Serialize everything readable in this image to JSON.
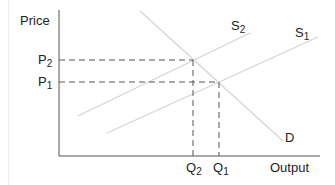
{
  "diagram": {
    "y_axis_label": "Price",
    "x_axis_label": "Output",
    "price_labels": [
      {
        "base": "P",
        "sub": "2"
      },
      {
        "base": "P",
        "sub": "1"
      }
    ],
    "quantity_labels": [
      {
        "base": "Q",
        "sub": "2"
      },
      {
        "base": "Q",
        "sub": "1"
      }
    ],
    "curves": [
      {
        "name": "D",
        "base": "D",
        "sub": ""
      },
      {
        "name": "S2",
        "base": "S",
        "sub": "2"
      },
      {
        "name": "S1",
        "base": "S",
        "sub": "1"
      }
    ],
    "colors": {
      "axis": "#555555",
      "curve": "#d4d4d4",
      "dashed": "#555555",
      "text": "#222222"
    }
  }
}
